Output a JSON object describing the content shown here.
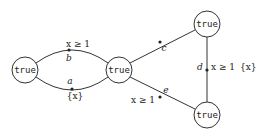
{
  "diagram": {
    "type": "timed-automaton",
    "nodes": [
      {
        "id": "n1",
        "label": "true",
        "cx": 25,
        "cy": 70
      },
      {
        "id": "n2",
        "label": "true",
        "cx": 119,
        "cy": 70
      },
      {
        "id": "n3",
        "label": "true",
        "cx": 207,
        "cy": 24
      },
      {
        "id": "n4",
        "label": "true",
        "cx": 207,
        "cy": 115
      }
    ],
    "edges": [
      {
        "id": "b",
        "from": "n2",
        "to": "n1",
        "action": "b",
        "guard": "x ≥ 1",
        "reset": ""
      },
      {
        "id": "a",
        "from": "n1",
        "to": "n2",
        "action": "a",
        "guard": "",
        "reset": "{x}"
      },
      {
        "id": "c",
        "from": "n2",
        "to": "n3",
        "action": "c",
        "guard": "",
        "reset": ""
      },
      {
        "id": "d",
        "from": "n3",
        "to": "n4",
        "action": "d",
        "guard": "x ≥ 1",
        "reset": "{x}"
      },
      {
        "id": "e",
        "from": "n4",
        "to": "n2",
        "action": "e",
        "guard": "x ≥ 1",
        "reset": ""
      }
    ]
  },
  "labels": {
    "n1": "true",
    "n2": "true",
    "n3": "true",
    "n4": "true",
    "edge_b_action": "b",
    "edge_b_guard": "x ≥ 1",
    "edge_a_action": "a",
    "edge_a_reset": "{x}",
    "edge_c_action": "c",
    "edge_d_action": "d",
    "edge_d_guard": "x ≥ 1",
    "edge_d_reset": "{x}",
    "edge_e_action": "e",
    "edge_e_guard": "x ≥ 1"
  }
}
